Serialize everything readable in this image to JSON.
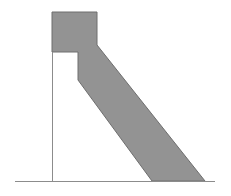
{
  "figure": {
    "caption": "",
    "background_color": "#ffffff",
    "fill_color": "#939393",
    "stroke_color": "#6e6e6e",
    "line_color": "#8c8c8c",
    "ground_line_color": "#8c8c8c"
  },
  "chart_data": {
    "type": "diagram",
    "title": "",
    "xlabel": "",
    "ylabel": "",
    "canvas": {
      "width": 231,
      "height": 196
    },
    "elements": [
      {
        "name": "shaded-body",
        "kind": "polygon",
        "fill": "#939393",
        "stroke": "#6e6e6e",
        "stroke_width": 1,
        "points": [
          [
            52,
            12
          ],
          [
            97,
            12
          ],
          [
            97,
            45
          ],
          [
            205,
            181
          ],
          [
            152,
            181
          ],
          [
            78,
            80
          ],
          [
            78,
            52
          ],
          [
            52,
            52
          ]
        ]
      },
      {
        "name": "vertical-datum-line",
        "kind": "line",
        "stroke": "#8c8c8c",
        "stroke_width": 1,
        "x1": 52,
        "y1": 52,
        "x2": 52,
        "y2": 181
      },
      {
        "name": "ground-line",
        "kind": "line",
        "stroke": "#8c8c8c",
        "stroke_width": 1,
        "x1": 15,
        "y1": 181,
        "x2": 215,
        "y2": 181
      }
    ],
    "axis_ranges": {
      "x": [
        0,
        231
      ],
      "y": [
        0,
        196
      ]
    },
    "grid": false,
    "legend": null
  }
}
